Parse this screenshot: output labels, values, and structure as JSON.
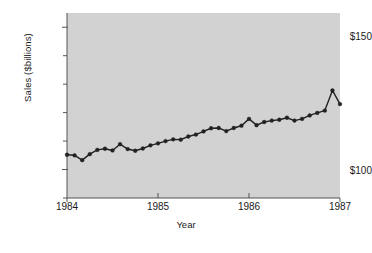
{
  "chart_data": {
    "type": "line",
    "title": "",
    "xlabel": "Year",
    "ylabel": "Sales ($billions)",
    "x_tick_labels": [
      "1984",
      "1985",
      "1986",
      "1987"
    ],
    "x_tick_values": [
      1984,
      1985,
      1986,
      1987
    ],
    "y_tick_labels": [
      "$150",
      "$100"
    ],
    "y_tick_values": [
      150,
      100
    ],
    "xlim": [
      1984,
      1987
    ],
    "ylim": [
      90,
      155
    ],
    "grid": false,
    "legend": null,
    "marker": "filled-circle",
    "line_color": "#222222",
    "marker_color": "#222222",
    "plot_background": "#d2d2d2",
    "figure_background": "#ffffff",
    "y_minor_tick_values": [
      150,
      140,
      130,
      120,
      110,
      100,
      90
    ],
    "series": [
      {
        "name": "Sales",
        "x": [
          1984.0,
          1984.083,
          1984.167,
          1984.25,
          1984.333,
          1984.417,
          1984.5,
          1984.583,
          1984.667,
          1984.75,
          1984.833,
          1984.917,
          1985.0,
          1985.083,
          1985.167,
          1985.25,
          1985.333,
          1985.417,
          1985.5,
          1985.583,
          1985.667,
          1985.75,
          1985.833,
          1985.917,
          1986.0,
          1986.083,
          1986.167,
          1986.25,
          1986.333,
          1986.417,
          1986.5,
          1986.583,
          1986.667,
          1986.75,
          1986.833,
          1986.917,
          1987.0
        ],
        "values": [
          105.2,
          105.0,
          103.3,
          105.4,
          106.9,
          107.3,
          106.7,
          108.9,
          107.2,
          106.6,
          107.4,
          108.5,
          109.2,
          110.0,
          110.6,
          110.5,
          111.6,
          112.3,
          113.4,
          114.5,
          114.6,
          113.5,
          114.6,
          115.4,
          117.8,
          115.6,
          116.7,
          117.2,
          117.5,
          118.2,
          117.2,
          117.8,
          119.0,
          119.9,
          120.7,
          127.8,
          123.0
        ]
      }
    ]
  },
  "axes": {
    "y_title": "Sales ($billions)",
    "x_title": "Year",
    "y_top_label": "$150",
    "y_bottom_label": "$100",
    "x_labels": {
      "a": "1984",
      "b": "1985",
      "c": "1986",
      "d": "1987"
    }
  }
}
